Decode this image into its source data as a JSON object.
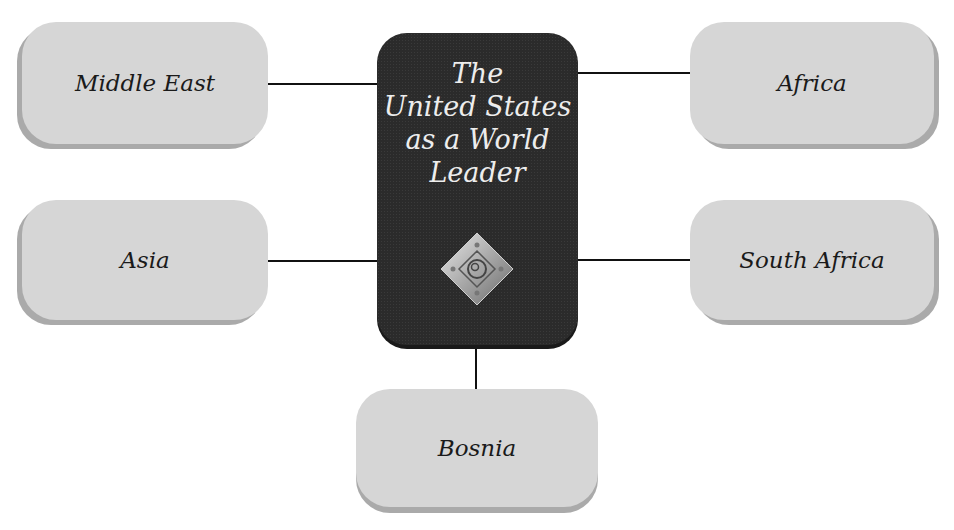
{
  "center": {
    "title_lines": [
      "The",
      "United States",
      "as a World",
      "Leader"
    ],
    "emblem_icon": "ornamental-diamond-emblem"
  },
  "nodes": {
    "middle_east": "Middle East",
    "asia": "Asia",
    "africa": "Africa",
    "south_africa": "South Africa",
    "bosnia": "Bosnia"
  },
  "colors": {
    "node_fill": "#d6d6d6",
    "center_fill": "#2b2b2b",
    "line": "#111111"
  }
}
